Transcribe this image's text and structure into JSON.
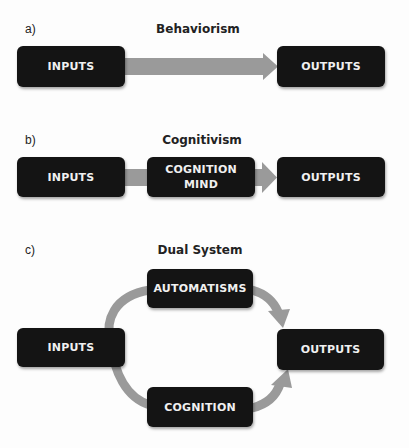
{
  "colors": {
    "background": "#fdfdfd",
    "node_fill": "#141414",
    "node_text": "#f0f0f0",
    "arrow": "#9a9a9a",
    "label_text": "#222222"
  },
  "panels": [
    {
      "label": "a)",
      "title": "Behaviorism",
      "nodes": [
        {
          "id": "inputs",
          "lines": [
            "INPUTS"
          ]
        },
        {
          "id": "outputs",
          "lines": [
            "OUTPUTS"
          ]
        }
      ],
      "edges": [
        {
          "from": "inputs",
          "to": "outputs"
        }
      ]
    },
    {
      "label": "b)",
      "title": "Cognitivism",
      "nodes": [
        {
          "id": "inputs",
          "lines": [
            "INPUTS"
          ]
        },
        {
          "id": "cognition_mind",
          "lines": [
            "COGNITION",
            "MIND"
          ]
        },
        {
          "id": "outputs",
          "lines": [
            "OUTPUTS"
          ]
        }
      ],
      "edges": [
        {
          "from": "inputs",
          "to": "outputs",
          "via": "cognition_mind"
        }
      ]
    },
    {
      "label": "c)",
      "title": "Dual System",
      "nodes": [
        {
          "id": "automatisms",
          "lines": [
            "AUTOMATISMS"
          ]
        },
        {
          "id": "inputs",
          "lines": [
            "INPUTS"
          ]
        },
        {
          "id": "outputs",
          "lines": [
            "OUTPUTS"
          ]
        },
        {
          "id": "cognition",
          "lines": [
            "COGNITION"
          ]
        }
      ],
      "edges": [
        {
          "from": "inputs",
          "to": "automatisms"
        },
        {
          "from": "automatisms",
          "to": "outputs"
        },
        {
          "from": "inputs",
          "to": "cognition"
        },
        {
          "from": "cognition",
          "to": "outputs"
        }
      ]
    }
  ]
}
